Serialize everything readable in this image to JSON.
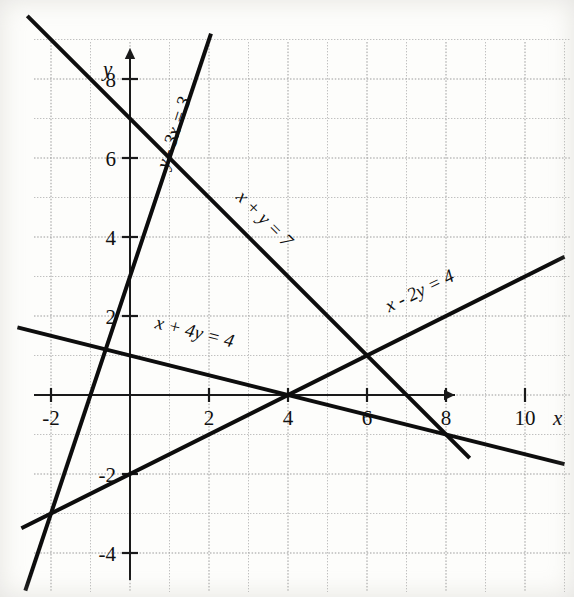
{
  "figure": {
    "kind": "coordinate-graph",
    "axis_x_label": "x",
    "axis_y_label": "y"
  },
  "chart_data": {
    "type": "line",
    "title": "",
    "xlabel": "x",
    "ylabel": "y",
    "xlim": [
      -3.4,
      11.2
    ],
    "ylim": [
      -4.9,
      9.5
    ],
    "grid": true,
    "grid_step": 1,
    "legend": "none",
    "x_ticks": [
      -2,
      2,
      4,
      6,
      8,
      10
    ],
    "x_tick_labels": [
      "-2",
      "2",
      "4",
      "6",
      "8",
      "10"
    ],
    "y_ticks": [
      -4,
      -2,
      2,
      4,
      6,
      8
    ],
    "y_tick_labels": [
      "-4",
      "-2",
      "2",
      "4",
      "6",
      "8"
    ],
    "series": [
      {
        "name": "y - 3x = 3",
        "equation": "y - 3x = 3",
        "slope": 3,
        "intercept": 3,
        "x_start": -2.65,
        "x_end": 2.05,
        "label": "y - 3x = 3",
        "label_x": 1.25,
        "label_y": 6.6,
        "label_rotation": -72
      },
      {
        "name": "x + y = 7",
        "equation": "x + y = 7",
        "slope": -1,
        "intercept": 7,
        "x_start": -2.6,
        "x_end": 8.6,
        "label": "x + y = 7",
        "label_x": 3.3,
        "label_y": 4.35,
        "label_rotation": 45
      },
      {
        "name": "x - 2y = 4",
        "equation": "x - 2y = 4",
        "slope": 0.5,
        "intercept": -2,
        "x_start": -2.75,
        "x_end": 11.0,
        "label": "x - 2y = 4",
        "label_x": 7.4,
        "label_y": 2.5,
        "label_rotation": -26
      },
      {
        "name": "x + 4y = 4",
        "equation": "x + 4y = 4",
        "slope": -0.25,
        "intercept": 1,
        "x_start": -2.85,
        "x_end": 11.0,
        "label": "x + 4y = 4",
        "label_x": 1.6,
        "label_y": 1.45,
        "label_rotation": 14
      }
    ],
    "intersections": [
      {
        "x": 1,
        "y": 6,
        "of": [
          "y - 3x = 3",
          "x + y = 7"
        ]
      },
      {
        "x": 4,
        "y": 0,
        "of": [
          "x - 2y = 4",
          "x + 4y = 4"
        ]
      },
      {
        "x": 6,
        "y": 1,
        "of": [
          "x + y = 7",
          "x - 2y = 4"
        ]
      },
      {
        "x": 8,
        "y": -1,
        "of": [
          "x + 4y = 4",
          "x + y = 7"
        ]
      },
      {
        "x": -2.4,
        "y": -3.2,
        "of": [
          "y - 3x = 3",
          "x - 2y = 4"
        ]
      }
    ]
  },
  "colors": {
    "line": "#0d0d0d",
    "axis": "#1a1a1a",
    "grid": "#b9b9b9",
    "background": "#fdfdfb"
  }
}
